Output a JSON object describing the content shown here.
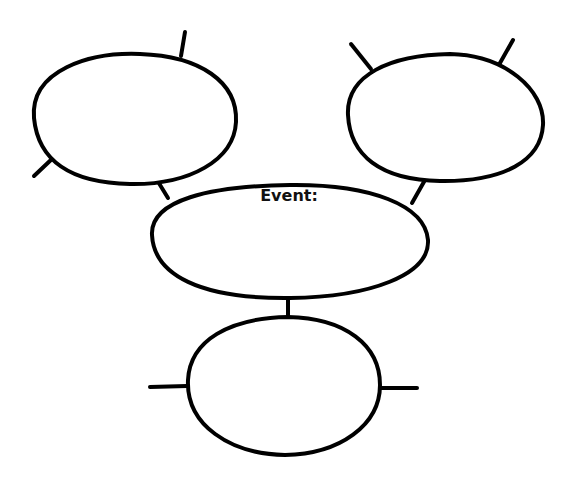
{
  "diagram": {
    "type": "event-web-organizer",
    "center": {
      "label": "Event:",
      "text": ""
    },
    "nodes": [
      {
        "id": "top-left",
        "text": ""
      },
      {
        "id": "top-right",
        "text": ""
      },
      {
        "id": "bottom",
        "text": ""
      }
    ],
    "colors": {
      "stroke": "#000000",
      "fill": "#ffffff",
      "text": "#111111"
    }
  }
}
